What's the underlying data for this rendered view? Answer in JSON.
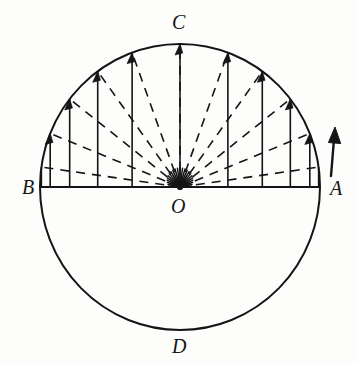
{
  "figure": {
    "type": "geometry-diagram",
    "background_color": "#fdfdfc",
    "stroke_color": "#151515"
  },
  "geometry": {
    "center": {
      "x": 180,
      "y": 187
    },
    "radius": 140,
    "radius_y": 143,
    "circle_stroke_width": 2.0,
    "diameter_stroke_width": 2.0,
    "ordinate_stroke_width": 1.6,
    "radius_stroke_width": 1.6,
    "dash_pattern": "9 7"
  },
  "points": [
    {
      "name": "A",
      "label": "A",
      "x": 320,
      "y": 187,
      "label_x": 330,
      "label_y": 178
    },
    {
      "name": "B",
      "label": "B",
      "x": 40,
      "y": 187,
      "label_x": 22,
      "label_y": 177
    },
    {
      "name": "C",
      "label": "C",
      "x": 180,
      "y": 44,
      "label_x": 172,
      "label_y": 12
    },
    {
      "name": "D",
      "label": "D",
      "x": 180,
      "y": 330,
      "label_x": 172,
      "label_y": 336
    },
    {
      "name": "O",
      "label": "O",
      "x": 180,
      "y": 187,
      "label_x": 171,
      "label_y": 196
    }
  ],
  "ordinates": {
    "count": 11,
    "comment": "angles measured from positive x-axis (point A), degrees; vertical chord-arrows from the diameter up to the arc",
    "angles_deg": [
      8,
      22,
      38,
      54,
      70,
      90,
      110,
      126,
      142,
      158,
      172
    ],
    "arrow_head_length": 11,
    "arrow_head_width": 5
  },
  "radii": {
    "count": 11,
    "comment": "dashed radii from center O out to each arc point",
    "angles_deg": [
      8,
      22,
      38,
      54,
      70,
      90,
      110,
      126,
      142,
      158,
      172
    ]
  },
  "external_arrow": {
    "name": "direction-arrow",
    "from": {
      "x": 331,
      "y": 176
    },
    "to": {
      "x": 335,
      "y": 127
    },
    "head_length": 16,
    "head_width": 7,
    "stroke_width": 2.4
  },
  "hub_rays": {
    "comment": "short dense solid rays radiating from O creating the dark star at the center",
    "count": 23,
    "length": 19,
    "angle_start_deg": 5,
    "angle_end_deg": 175
  }
}
